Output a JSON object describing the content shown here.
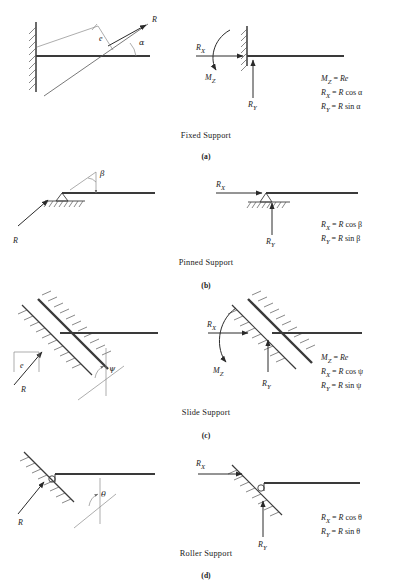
{
  "figure": {
    "line_color": "#3a3a3a",
    "text_color": "#1a1a1a"
  },
  "panels": [
    {
      "id": "a",
      "caption": "Fixed Support",
      "letter": "(a)",
      "angle_symbol": "α",
      "force_label": "R",
      "eccentricity_label": "e",
      "fbd_labels": {
        "rx": "R",
        "rx_sub": "X",
        "ry": "R",
        "ry_sub": "Y",
        "mz": "M",
        "mz_sub": "Z"
      },
      "equations": [
        {
          "lhs": "M",
          "lhs_sub": "Z",
          "rhs": "Re",
          "func": ""
        },
        {
          "lhs": "R",
          "lhs_sub": "X",
          "rhs": "R",
          "func": "cos α"
        },
        {
          "lhs": "R",
          "lhs_sub": "Y",
          "rhs": "R",
          "func": "sin α"
        }
      ]
    },
    {
      "id": "b",
      "caption": "Pinned Support",
      "letter": "(b)",
      "angle_symbol": "β",
      "force_label": "R",
      "eccentricity_label": "",
      "fbd_labels": {
        "rx": "R",
        "rx_sub": "X",
        "ry": "R",
        "ry_sub": "Y",
        "mz": "",
        "mz_sub": ""
      },
      "equations": [
        {
          "lhs": "R",
          "lhs_sub": "X",
          "rhs": "R",
          "func": "cos β"
        },
        {
          "lhs": "R",
          "lhs_sub": "Y",
          "rhs": "R",
          "func": "sin β"
        }
      ]
    },
    {
      "id": "c",
      "caption": "Slide Support",
      "letter": "(c)",
      "angle_symbol": "ψ",
      "force_label": "R",
      "eccentricity_label": "e",
      "fbd_labels": {
        "rx": "R",
        "rx_sub": "X",
        "ry": "R",
        "ry_sub": "Y",
        "mz": "M",
        "mz_sub": "Z"
      },
      "equations": [
        {
          "lhs": "M",
          "lhs_sub": "Z",
          "rhs": "Re",
          "func": ""
        },
        {
          "lhs": "R",
          "lhs_sub": "X",
          "rhs": "R",
          "func": "cos ψ"
        },
        {
          "lhs": "R",
          "lhs_sub": "Y",
          "rhs": "R",
          "func": "sin ψ"
        }
      ]
    },
    {
      "id": "d",
      "caption": "Roller Support",
      "letter": "(d)",
      "angle_symbol": "θ",
      "force_label": "R",
      "eccentricity_label": "",
      "fbd_labels": {
        "rx": "R",
        "rx_sub": "X",
        "ry": "R",
        "ry_sub": "Y",
        "mz": "",
        "mz_sub": ""
      },
      "equations": [
        {
          "lhs": "R",
          "lhs_sub": "X",
          "rhs": "R",
          "func": "cos θ"
        },
        {
          "lhs": "R",
          "lhs_sub": "Y",
          "rhs": "R",
          "func": "sin θ"
        }
      ]
    }
  ]
}
